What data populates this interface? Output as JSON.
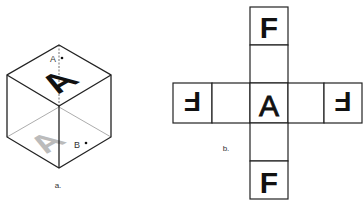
{
  "figure_a": {
    "label": "a.",
    "top_face_letter": "A",
    "bottom_face_letter_ghost": "A",
    "point_labels": [
      "A",
      "B"
    ]
  },
  "figure_b": {
    "label": "b.",
    "net_cells": {
      "top": "F",
      "upper_middle": "",
      "center": "A",
      "lower_middle": "",
      "bottom": "F",
      "far_left": "F",
      "left": "",
      "right": "",
      "far_right": "F"
    }
  },
  "colors": {
    "line": "#222222",
    "ghost": "#bbbbbb",
    "background": "#ffffff"
  }
}
